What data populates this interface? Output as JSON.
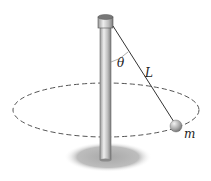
{
  "diagram": {
    "labels": {
      "theta": "θ",
      "length": "L",
      "mass": "m"
    },
    "colors": {
      "pole_light": "#e6e6e6",
      "pole_dark": "#8a8a8a",
      "rope": "#333333",
      "path_dash": "#555555",
      "shadow": "#b8b8b8",
      "ball": "#a8a8a8"
    }
  }
}
